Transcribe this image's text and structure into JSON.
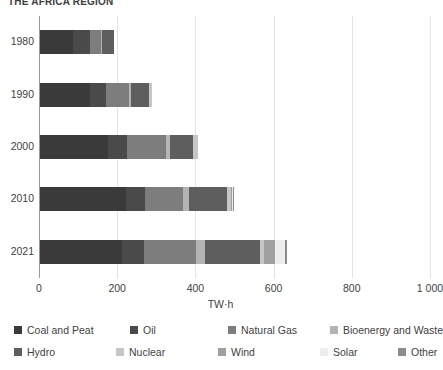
{
  "chart_data": {
    "type": "bar",
    "orientation": "horizontal",
    "stacked": true,
    "title": "THE AFRICA REGION",
    "xlabel": "TW·h",
    "ylabel": "",
    "xlim": [
      0,
      1000
    ],
    "xticks": [
      0,
      200,
      400,
      600,
      800,
      1000
    ],
    "xtick_labels": [
      "0",
      "200",
      "400",
      "600",
      "800",
      "1 000"
    ],
    "grid": "vertical",
    "legend_position": "bottom",
    "categories": [
      "1980",
      "1990",
      "2000",
      "2010",
      "2021"
    ],
    "series": [
      {
        "name": "Coal and Peat",
        "color": "#3a3a3a",
        "values": [
          88,
          130,
          176,
          222,
          212
        ]
      },
      {
        "name": "Oil",
        "color": "#4a4a4a",
        "values": [
          42,
          42,
          48,
          48,
          56
        ]
      },
      {
        "name": "Natural Gas",
        "color": "#7d7d7d",
        "values": [
          28,
          58,
          100,
          98,
          134
        ]
      },
      {
        "name": "Bioenergy and Waste",
        "color": "#b4b4b4",
        "values": [
          4,
          6,
          10,
          16,
          22
        ]
      },
      {
        "name": "Hydro",
        "color": "#5e5e5e",
        "values": [
          30,
          46,
          60,
          96,
          140
        ]
      },
      {
        "name": "Nuclear",
        "color": "#c6c6c6",
        "values": [
          0,
          8,
          12,
          12,
          12
        ]
      },
      {
        "name": "Wind",
        "color": "#a0a0a0",
        "values": [
          0,
          0,
          0,
          2,
          28
        ]
      },
      {
        "name": "Solar",
        "color": "#ededed",
        "values": [
          0,
          0,
          0,
          1,
          24
        ]
      },
      {
        "name": "Other",
        "color": "#8c8c8c",
        "values": [
          0,
          0,
          0,
          1,
          6
        ]
      }
    ],
    "totals": [
      192,
      290,
      406,
      496,
      634
    ]
  },
  "legend": {
    "row1": [
      {
        "label": "Coal and Peat"
      },
      {
        "label": "Oil"
      },
      {
        "label": "Natural Gas"
      },
      {
        "label": "Bioenergy and Waste"
      }
    ],
    "row2": [
      {
        "label": "Hydro"
      },
      {
        "label": "Nuclear"
      },
      {
        "label": "Wind"
      },
      {
        "label": "Solar"
      },
      {
        "label": "Other"
      }
    ]
  }
}
